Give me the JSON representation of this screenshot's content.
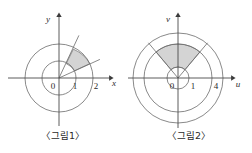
{
  "figures": [
    {
      "id": "figure-1",
      "caption": "〈그림1〉",
      "axes": {
        "horizontal_label": "x",
        "vertical_label": "v_unused"
      },
      "axis_x_label": "x",
      "axis_y_label": "y",
      "origin_label": "0",
      "tick_labels": [
        "0",
        "1",
        "2"
      ],
      "tick_1": "1",
      "tick_2": "2",
      "circles": [
        {
          "radius_value": 1,
          "radius_px": 17
        },
        {
          "radius_value": 2,
          "radius_px": 34
        }
      ],
      "shaded_sector": {
        "inner_radius_value": 1,
        "outer_radius_value": 2,
        "start_angle_deg": 25,
        "end_angle_deg": 65,
        "fill_color": "#d4d4d4"
      },
      "rays": [
        {
          "angle_deg": 25,
          "length_px": 44
        },
        {
          "angle_deg": 65,
          "length_px": 47
        }
      ]
    },
    {
      "id": "figure-2",
      "caption": "〈그림2〉",
      "axis_x_label": "u",
      "axis_y_label": "v",
      "origin_label": "0",
      "tick_labels": [
        "0",
        "1",
        "4"
      ],
      "tick_1": "1",
      "tick_4": "4",
      "circles": [
        {
          "radius_value": 1,
          "radius_px": 11
        },
        {
          "radius_value": 4,
          "radius_px": 34
        },
        {
          "radius_value": 5,
          "radius_px": 45
        }
      ],
      "shaded_sector": {
        "inner_radius_value": 1,
        "outer_radius_value": 4,
        "start_angle_deg": 50,
        "end_angle_deg": 130,
        "fill_color": "#d4d4d4"
      },
      "rays": [
        {
          "angle_deg": 50,
          "length_px": 46
        },
        {
          "angle_deg": 130,
          "length_px": 46
        }
      ]
    }
  ],
  "style": {
    "stroke_color": "#5a5a5a",
    "axis_color": "#4a4a4a",
    "text_color": "#2b2b2b",
    "shade_color": "#d4d4d4",
    "background": "#ffffff"
  }
}
